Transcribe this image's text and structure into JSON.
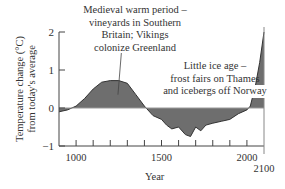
{
  "chart_data": {
    "type": "area",
    "title": "",
    "xlabel": "Year",
    "ylabel": "Temperature change (°C) from today's average",
    "ylabel_lines": [
      "Temperature change (°C)",
      "from today's average"
    ],
    "xlim": [
      900,
      2100
    ],
    "ylim": [
      -1,
      2
    ],
    "yticks": [
      2,
      1,
      0,
      -1
    ],
    "xtick_labels": [
      "1000",
      "1500",
      "2000",
      "2100"
    ],
    "x": [
      900,
      950,
      1000,
      1050,
      1100,
      1150,
      1200,
      1250,
      1300,
      1350,
      1400,
      1450,
      1500,
      1530,
      1560,
      1600,
      1640,
      1670,
      1700,
      1730,
      1760,
      1800,
      1850,
      1900,
      1950,
      2000,
      2020,
      2050,
      2075,
      2100
    ],
    "series": [
      {
        "name": "Temperature change",
        "values": [
          -0.1,
          -0.05,
          0.05,
          0.25,
          0.5,
          0.68,
          0.72,
          0.72,
          0.65,
          0.35,
          0.05,
          -0.2,
          -0.3,
          -0.45,
          -0.55,
          -0.5,
          -0.7,
          -0.75,
          -0.5,
          -0.6,
          -0.45,
          -0.4,
          -0.35,
          -0.3,
          -0.15,
          -0.05,
          0.05,
          0.6,
          1.2,
          2.0
        ]
      }
    ],
    "annotations": [
      {
        "lines": [
          "Medieval warm period –",
          "vineyards in Southern",
          "Britain; Vikings",
          "colonize Greenland"
        ],
        "points_to_year": 1250
      },
      {
        "lines": [
          "Little ice age –",
          "frost fairs on Thames",
          "and icebergs off Norway"
        ],
        "points_to_year": 1700
      }
    ],
    "colors": {
      "fill": "#6e6e6e",
      "line": "#333333",
      "axis": "#444444"
    }
  }
}
